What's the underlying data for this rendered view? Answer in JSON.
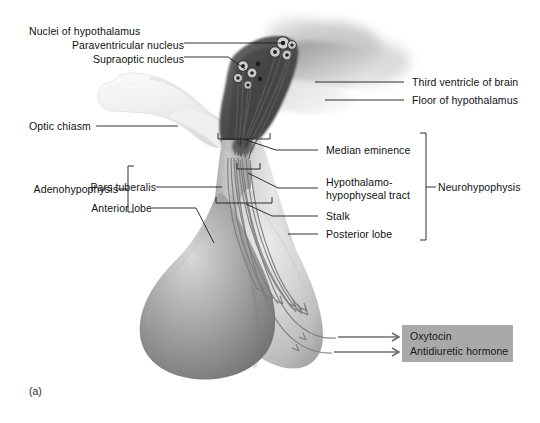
{
  "figure": {
    "panel_label": "(a)",
    "title_context": "Hypothalamus and pituitary gland (hypophysis) sagittal section"
  },
  "labels": {
    "nuclei_group": "Nuclei of hypothalamus",
    "paraventricular_nucleus": "Paraventricular nucleus",
    "supraoptic_nucleus": "Supraoptic nucleus",
    "optic_chiasm": "Optic chiasm",
    "third_ventricle": "Third ventricle of brain",
    "floor_of_hypothalamus": "Floor of hypothalamus",
    "median_eminence": "Median eminence",
    "tract_line1": "Hypothalamo-",
    "tract_line2": "hypophyseal tract",
    "stalk": "Stalk",
    "posterior_lobe": "Posterior lobe",
    "pars_tuberalis": "Pars tuberalis",
    "anterior_lobe": "Anterior lobe",
    "adenohypophysis": "Adenohypophysis",
    "neurohypophysis": "Neurohypophysis"
  },
  "hormone_box": {
    "background_color": "#a9a9a9",
    "items": [
      "Oxytocin",
      "Antidiuretic hormone"
    ]
  },
  "colors": {
    "leader_line": "#1a1a1a",
    "text": "#111111",
    "arrow": "#6e6e6e",
    "anterior_lobe_dark": "#8d8d8d",
    "posterior_lobe_light": "#d2d2d2",
    "hypothalamus_dark": "#4a4a4a",
    "optic_chiasm_light": "#efefef",
    "box_gray": "#a9a9a9"
  }
}
